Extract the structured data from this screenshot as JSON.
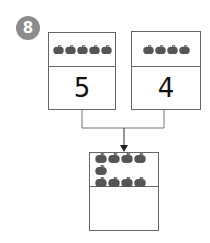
{
  "badge": {
    "label": "8"
  },
  "boxes": [
    {
      "apples": 5,
      "number": "5"
    },
    {
      "apples": 4,
      "number": "4"
    },
    {
      "apples": 9,
      "number": ""
    }
  ],
  "colors": {
    "badge": "#8c8c8c",
    "apple": "#555555",
    "line": "#666666"
  }
}
